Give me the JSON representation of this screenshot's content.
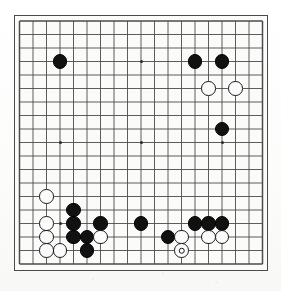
{
  "diagram": {
    "kind": "go-board-diagram",
    "board_size": 19,
    "background_color": "#fbfbfa",
    "line_color": "#4b4b4b",
    "black_stone_color": "#111111",
    "white_stone_color": "#fbfbfb",
    "white_stone_border_color": "#1a1a1a",
    "geometry": {
      "board_left": 14,
      "board_top": 15,
      "board_width": 254,
      "board_height": 256,
      "origin_x": 5.5,
      "origin_y": 6.0,
      "spacing": 13.5,
      "stone_diameter": 14.5,
      "hoshi_diameter": 3
    },
    "star_points": [
      {
        "col": 3,
        "row": 3
      },
      {
        "col": 9,
        "row": 3
      },
      {
        "col": 15,
        "row": 3
      },
      {
        "col": 3,
        "row": 9
      },
      {
        "col": 9,
        "row": 9
      },
      {
        "col": 15,
        "row": 9
      },
      {
        "col": 3,
        "row": 15
      },
      {
        "col": 9,
        "row": 15
      },
      {
        "col": 15,
        "row": 15
      }
    ],
    "stones": [
      {
        "color": "black",
        "col": 3,
        "row": 3,
        "marked": false
      },
      {
        "color": "black",
        "col": 13,
        "row": 3,
        "marked": false
      },
      {
        "color": "black",
        "col": 15,
        "row": 3,
        "marked": false
      },
      {
        "color": "white",
        "col": 14,
        "row": 5,
        "marked": false
      },
      {
        "color": "white",
        "col": 16,
        "row": 5,
        "marked": false
      },
      {
        "color": "black",
        "col": 15,
        "row": 8,
        "marked": false
      },
      {
        "color": "white",
        "col": 2,
        "row": 13,
        "marked": false
      },
      {
        "color": "black",
        "col": 4,
        "row": 14,
        "marked": false
      },
      {
        "color": "white",
        "col": 2,
        "row": 15,
        "marked": false
      },
      {
        "color": "black",
        "col": 4,
        "row": 15,
        "marked": false
      },
      {
        "color": "black",
        "col": 6,
        "row": 15,
        "marked": false
      },
      {
        "color": "black",
        "col": 9,
        "row": 15,
        "marked": false
      },
      {
        "color": "black",
        "col": 13,
        "row": 15,
        "marked": false
      },
      {
        "color": "black",
        "col": 14,
        "row": 15,
        "marked": false
      },
      {
        "color": "black",
        "col": 15,
        "row": 15,
        "marked": false
      },
      {
        "color": "white",
        "col": 2,
        "row": 16,
        "marked": false
      },
      {
        "color": "black",
        "col": 4,
        "row": 16,
        "marked": false
      },
      {
        "color": "black",
        "col": 5,
        "row": 16,
        "marked": false
      },
      {
        "color": "white",
        "col": 6,
        "row": 16,
        "marked": false
      },
      {
        "color": "black",
        "col": 11,
        "row": 16,
        "marked": false
      },
      {
        "color": "white",
        "col": 12,
        "row": 16,
        "marked": false
      },
      {
        "color": "white",
        "col": 14,
        "row": 16,
        "marked": false
      },
      {
        "color": "white",
        "col": 15,
        "row": 16,
        "marked": false
      },
      {
        "color": "white",
        "col": 2,
        "row": 17,
        "marked": false
      },
      {
        "color": "white",
        "col": 3,
        "row": 17,
        "marked": false
      },
      {
        "color": "black",
        "col": 5,
        "row": 17,
        "marked": false
      },
      {
        "color": "white",
        "col": 12,
        "row": 17,
        "marked": true
      }
    ],
    "stone_counts": {
      "black": 15,
      "white": 12,
      "marked": 1
    }
  }
}
